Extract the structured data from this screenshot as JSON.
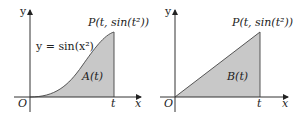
{
  "colors": {
    "fill": "#c8c8c8",
    "stroke": "#555555",
    "axis": "#333333",
    "background": "#ffffff"
  },
  "left_panel": {
    "y_axis_label": "y",
    "x_axis_label": "x",
    "origin_label": "O",
    "t_label": "t",
    "curve_label": "y = sin(x²)",
    "point_label": "P(t, sin(t²))",
    "region_label": "A(t)"
  },
  "right_panel": {
    "y_axis_label": "y",
    "x_axis_label": "x",
    "origin_label": "O",
    "t_label": "t",
    "point_label": "P(t, sin(t²))",
    "region_label": "B(t)"
  }
}
